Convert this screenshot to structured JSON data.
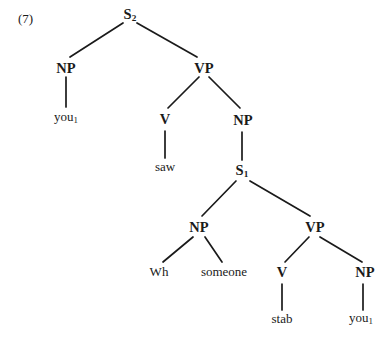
{
  "figure": {
    "example_number": "(7)",
    "ink_color": "#1a1a1a",
    "background_color": "#ffffff"
  },
  "tree": {
    "nodes": {
      "s2": {
        "label": "S",
        "subscript": "2"
      },
      "np_subject": {
        "label": "NP"
      },
      "you_matrix": {
        "label": "you",
        "subscript": "1"
      },
      "vp_matrix": {
        "label": "VP"
      },
      "v_matrix": {
        "label": "V"
      },
      "saw": {
        "label": "saw"
      },
      "np_object": {
        "label": "NP"
      },
      "s1": {
        "label": "S",
        "subscript": "1"
      },
      "np_embedded": {
        "label": "NP"
      },
      "wh": {
        "label": "Wh"
      },
      "someone": {
        "label": "someone"
      },
      "vp_embedded": {
        "label": "VP"
      },
      "v_embedded": {
        "label": "V"
      },
      "stab": {
        "label": "stab"
      },
      "np_embedded_object": {
        "label": "NP"
      },
      "you_embedded": {
        "label": "you",
        "subscript": "1"
      }
    }
  }
}
